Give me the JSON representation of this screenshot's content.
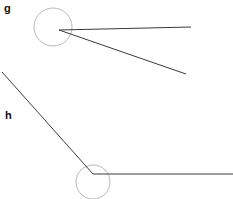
{
  "figure": {
    "width": 233,
    "height": 199,
    "background_color": "#ffffff",
    "line_color": "#333333",
    "circle_color": "#b0b0b0",
    "label_color": "#111111",
    "labels": [
      {
        "id": "g",
        "text": "g",
        "x": 4,
        "y": 3
      },
      {
        "id": "h",
        "text": "h",
        "x": 5,
        "y": 110
      }
    ],
    "shapes": [
      {
        "name": "angle-g-circle",
        "type": "circle",
        "cx": 53,
        "cy": 27,
        "r": 19,
        "stroke": "#b8b8b8",
        "stroke_width": 1,
        "fill": "none"
      },
      {
        "name": "angle-g-ray-upper",
        "type": "line",
        "x1": 59,
        "y1": 30,
        "x2": 191,
        "y2": 27,
        "stroke": "#3a3a3a",
        "stroke_width": 1
      },
      {
        "name": "angle-g-ray-lower",
        "type": "line",
        "x1": 59,
        "y1": 30,
        "x2": 186,
        "y2": 74,
        "stroke": "#3a3a3a",
        "stroke_width": 1
      },
      {
        "name": "angle-h-circle",
        "type": "circle",
        "cx": 93,
        "cy": 182,
        "r": 17,
        "stroke": "#b8b8b8",
        "stroke_width": 1,
        "fill": "none"
      },
      {
        "name": "angle-h-ray-diagonal",
        "type": "line",
        "x1": 2,
        "y1": 72,
        "x2": 93,
        "y2": 174,
        "stroke": "#3a3a3a",
        "stroke_width": 1
      },
      {
        "name": "angle-h-ray-horizontal",
        "type": "line",
        "x1": 93,
        "y1": 174,
        "x2": 233,
        "y2": 174,
        "stroke": "#3a3a3a",
        "stroke_width": 1
      }
    ]
  }
}
